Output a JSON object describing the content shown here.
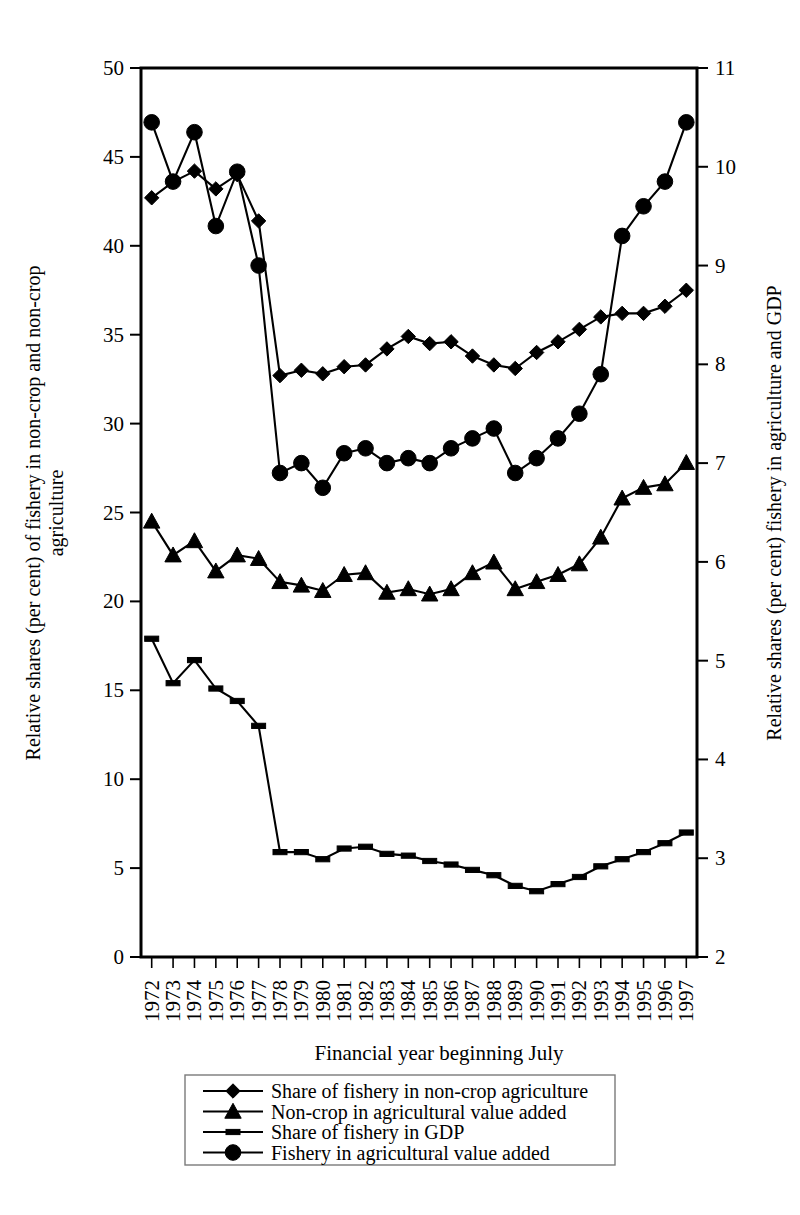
{
  "chart_data": {
    "type": "line",
    "title": "",
    "xlabel": "Financial year beginning July",
    "ylabel": "Relative shares  (per cent) of fishery in non-crop and non-crop agriculture",
    "y2label": "Relative shares (per cent) fishery in agriculture and GDP",
    "grid": false,
    "legend_position": "bottom",
    "x": [
      1972,
      1973,
      1974,
      1975,
      1976,
      1977,
      1978,
      1979,
      1980,
      1981,
      1982,
      1983,
      1984,
      1985,
      1986,
      1987,
      1988,
      1989,
      1990,
      1991,
      1992,
      1993,
      1994,
      1995,
      1996,
      1997
    ],
    "categories": [
      "1972",
      "1973",
      "1974",
      "1975",
      "1976",
      "1977",
      "1978",
      "1979",
      "1980",
      "1981",
      "1982",
      "1983",
      "1984",
      "1985",
      "1986",
      "1987",
      "1988",
      "1989",
      "1990",
      "1991",
      "1992",
      "1993",
      "1994",
      "1995",
      "1996",
      "1997"
    ],
    "ylim": [
      0,
      50
    ],
    "yticks": [
      0,
      5,
      10,
      15,
      20,
      25,
      30,
      35,
      40,
      45,
      50
    ],
    "y2lim": [
      2,
      11
    ],
    "y2ticks": [
      2,
      3,
      4,
      5,
      6,
      7,
      8,
      9,
      10,
      11
    ],
    "series": [
      {
        "name": "Share of fishery in non-crop agriculture",
        "marker": "diamond",
        "axis": "left",
        "values": [
          42.7,
          43.6,
          44.2,
          43.2,
          44.0,
          41.4,
          32.7,
          33.0,
          32.8,
          33.2,
          33.3,
          34.2,
          34.9,
          34.5,
          34.6,
          33.8,
          33.3,
          33.1,
          34.0,
          34.6,
          35.3,
          36.0,
          36.2,
          36.2,
          36.6,
          37.5
        ]
      },
      {
        "name": "Non-crop in agricultural value added",
        "marker": "triangle",
        "axis": "left",
        "values": [
          24.5,
          22.6,
          23.4,
          21.7,
          22.6,
          22.4,
          21.1,
          20.9,
          20.6,
          21.5,
          21.6,
          20.5,
          20.7,
          20.4,
          20.7,
          21.6,
          22.2,
          20.7,
          21.1,
          21.5,
          22.1,
          23.6,
          25.8,
          26.4,
          26.6,
          27.8
        ]
      },
      {
        "name": "Share of fishery in GDP",
        "marker": "dash",
        "axis": "left",
        "values": [
          17.9,
          15.4,
          16.7,
          15.1,
          14.4,
          13.0,
          5.9,
          5.9,
          5.5,
          6.1,
          6.2,
          5.8,
          5.7,
          5.4,
          5.2,
          4.9,
          4.6,
          4.0,
          3.7,
          4.1,
          4.5,
          5.1,
          5.5,
          5.9,
          6.4,
          7.0
        ]
      },
      {
        "name": "Fishery in agricultural value added",
        "marker": "circle",
        "axis": "right",
        "values": [
          10.45,
          9.85,
          10.35,
          9.4,
          9.95,
          9.0,
          6.9,
          7.0,
          6.75,
          7.1,
          7.15,
          7.0,
          7.05,
          7.0,
          7.15,
          7.25,
          7.35,
          6.9,
          7.05,
          7.25,
          7.5,
          7.9,
          9.3,
          9.6,
          9.85,
          10.45
        ]
      }
    ],
    "legend": [
      {
        "label": "Share of fishery in non-crop agriculture",
        "marker": "diamond"
      },
      {
        "label": "Non-crop in agricultural value added",
        "marker": "triangle"
      },
      {
        "label": "Share of fishery in GDP",
        "marker": "dash"
      },
      {
        "label": "Fishery in agricultural value added",
        "marker": "circle"
      }
    ]
  }
}
